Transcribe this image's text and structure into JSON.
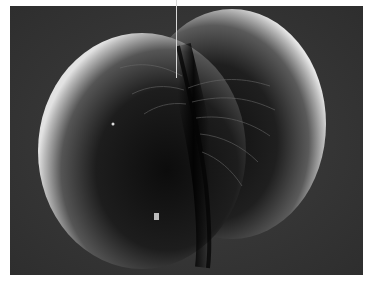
{
  "figure": {
    "label_pointer": {
      "x": 176,
      "y_start": 0,
      "y_end": 78
    },
    "colors": {
      "background": "#3a3a3a",
      "cell_shadow": "#141414",
      "cell_highlight": "#d6d6d6",
      "page": "#ffffff"
    }
  }
}
